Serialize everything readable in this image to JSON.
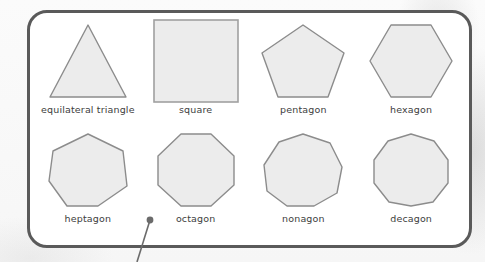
{
  "figure": {
    "title_visible": false,
    "frame": {
      "border_color": "#5a5a5a",
      "fill_color": "#ffffff",
      "corner_radius_px": 20
    },
    "shape_style": {
      "fill": "#ececec",
      "stroke": "#8c8c8c"
    },
    "label_color": "#3d3d3d"
  },
  "callout": {
    "dot_label": "",
    "dot_color": "#6b6b6b",
    "line_color": "#6b6b6b",
    "dot_x": 150,
    "dot_y": 220,
    "line_end_x": 137,
    "line_end_y": 262
  },
  "shapes": [
    {
      "label": "equilateral triangle",
      "sides": 3,
      "icon": "triangle-icon"
    },
    {
      "label": "square",
      "sides": 4,
      "icon": "square-icon"
    },
    {
      "label": "pentagon",
      "sides": 5,
      "icon": "pentagon-icon"
    },
    {
      "label": "hexagon",
      "sides": 6,
      "icon": "hexagon-icon"
    },
    {
      "label": "heptagon",
      "sides": 7,
      "icon": "heptagon-icon"
    },
    {
      "label": "octagon",
      "sides": 8,
      "icon": "octagon-icon"
    },
    {
      "label": "nonagon",
      "sides": 9,
      "icon": "nonagon-icon"
    },
    {
      "label": "decagon",
      "sides": 10,
      "icon": "decagon-icon"
    }
  ]
}
